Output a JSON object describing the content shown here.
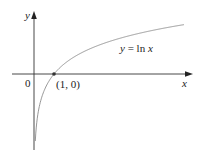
{
  "chart_data": {
    "type": "line",
    "title": "",
    "xlabel": "x",
    "ylabel": "y",
    "origin_label": "0",
    "series": [
      {
        "name": "y = ln x",
        "function": "ln(x)",
        "x": [
          0.05,
          0.1,
          0.2,
          0.5,
          1,
          2,
          3,
          4,
          5,
          6,
          7,
          8
        ],
        "values": [
          -3.0,
          -2.303,
          -1.609,
          -0.693,
          0,
          0.693,
          1.099,
          1.386,
          1.609,
          1.792,
          1.946,
          2.079
        ]
      }
    ],
    "annotations": [
      {
        "text": "(1, 0)",
        "x": 1,
        "y": 0,
        "marker": "point"
      },
      {
        "text": "y = ln x",
        "position": "above curve, right side"
      }
    ],
    "grid": false,
    "legend": "none",
    "colors": {
      "curve": "#8a8a8a",
      "axes": "#333333",
      "point": "#333333"
    }
  },
  "labels": {
    "y_axis": "y",
    "x_axis": "x",
    "origin": "0",
    "point": "(1, 0)",
    "curve_y": "y",
    "curve_eq": " = ln ",
    "curve_x": "x"
  }
}
